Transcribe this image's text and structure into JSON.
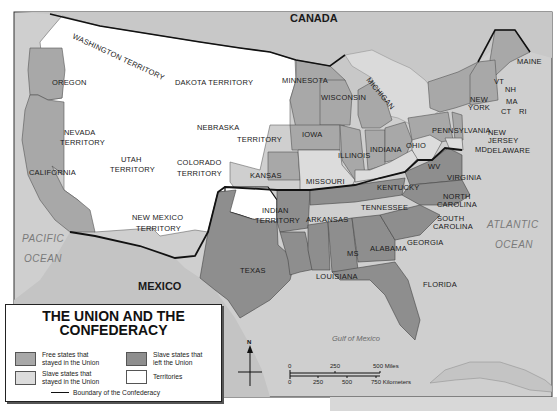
{
  "map": {
    "title": "THE UNION AND THE CONFEDERACY",
    "title_line1": "THE UNION AND THE",
    "title_line2": "CONFEDERACY",
    "colors": {
      "free_union": "#a8a8a8",
      "slave_union": "#dcdcdc",
      "confederate": "#8e8e8e",
      "territory": "#ffffff",
      "water": "#cfcfcf",
      "foreign_land": "#c4c4c4",
      "boundary": "#111111"
    },
    "countries": {
      "canada": "CANADA",
      "mexico": "MEXICO"
    },
    "water_bodies": {
      "pacific_1": "PACIFIC",
      "pacific_2": "OCEAN",
      "atlantic_1": "ATLANTIC",
      "atlantic_2": "OCEAN",
      "gulf": "Gulf of Mexico"
    },
    "territories": {
      "washington": "WASHINGTON TERRITORY",
      "dakota": "DAKOTA TERRITORY",
      "nebraska_1": "NEBRASKA",
      "nebraska_2": "TERRITORY",
      "nevada_1": "NEVADA",
      "nevada_2": "TERRITORY",
      "utah_1": "UTAH",
      "utah_2": "TERRITORY",
      "colorado_1": "COLORADO",
      "colorado_2": "TERRITORY",
      "new_mexico_1": "NEW MEXICO",
      "new_mexico_2": "TERRITORY",
      "indian_1": "INDIAN",
      "indian_2": "TERRITORY"
    },
    "free_states": {
      "oregon": "OREGON",
      "california": "CALIFORNIA",
      "minnesota": "MINNESOTA",
      "wisconsin": "WISCONSIN",
      "michigan": "MICHIGAN",
      "iowa": "IOWA",
      "illinois": "ILLINOIS",
      "indiana": "INDIANA",
      "ohio": "OHIO",
      "kansas": "KANSAS",
      "pennsylvania": "PENNSYLVANIA",
      "new_york_1": "NEW",
      "new_york_2": "YORK",
      "new_jersey_1": "NEW",
      "new_jersey_2": "JERSEY",
      "maine": "MAINE",
      "vt": "VT",
      "nh": "NH",
      "ma": "MA",
      "ct": "CT",
      "ri": "RI"
    },
    "slave_union_states": {
      "missouri": "MISSOURI",
      "kentucky": "KENTUCKY",
      "wv": "WV",
      "md": "MD",
      "delaware": "DELAWARE"
    },
    "confederate_states": {
      "texas": "TEXAS",
      "arkansas": "ARKANSAS",
      "louisiana": "LOUISIANA",
      "ms": "MS",
      "alabama": "ALABAMA",
      "georgia": "GEORGIA",
      "florida": "FLORIDA",
      "tennessee": "TENNESSEE",
      "virginia": "VIRGINIA",
      "north_carolina_1": "NORTH",
      "north_carolina_2": "CAROLINA",
      "south_carolina_1": "SOUTH",
      "south_carolina_2": "CAROLINA"
    },
    "compass": {
      "north_label": "N"
    },
    "scale": {
      "miles_ticks": [
        "0",
        "250",
        "500 Miles"
      ],
      "km_ticks": [
        "0",
        "250",
        "500",
        "750 Kilometers"
      ]
    }
  },
  "legend": {
    "title_line1": "THE UNION AND THE",
    "title_line2": "CONFEDERACY",
    "items": [
      {
        "label_1": "Free states that",
        "label_2": "stayed in the Union",
        "color": "#a8a8a8"
      },
      {
        "label_1": "Slave states that",
        "label_2": "left the Union",
        "color": "#8e8e8e"
      },
      {
        "label_1": "Slave states that",
        "label_2": "stayed in the Union",
        "color": "#dcdcdc"
      },
      {
        "label_1": "Territories",
        "label_2": "",
        "color": "#ffffff"
      }
    ],
    "boundary_label": "Boundary of the Confederacy"
  }
}
